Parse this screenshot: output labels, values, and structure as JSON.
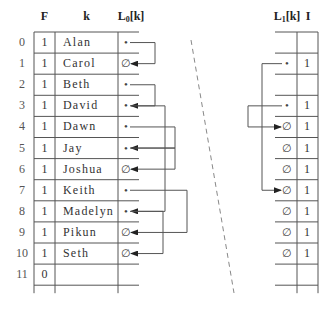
{
  "left_table": {
    "headers": {
      "F": "F",
      "k": "k",
      "L0_main": "L",
      "L0_sub": "0",
      "L0_tail": "[k]"
    },
    "rows": [
      {
        "index": "0",
        "F": "1",
        "k": "Alan",
        "L0": "•"
      },
      {
        "index": "1",
        "F": "1",
        "k": "Carol",
        "L0": "∅"
      },
      {
        "index": "2",
        "F": "1",
        "k": "Beth",
        "L0": "•"
      },
      {
        "index": "3",
        "F": "1",
        "k": "David",
        "L0": "•"
      },
      {
        "index": "4",
        "F": "1",
        "k": "Dawn",
        "L0": "•"
      },
      {
        "index": "5",
        "F": "1",
        "k": "Jay",
        "L0": "•"
      },
      {
        "index": "6",
        "F": "1",
        "k": "Joshua",
        "L0": "∅"
      },
      {
        "index": "7",
        "F": "1",
        "k": "Keith",
        "L0": "•"
      },
      {
        "index": "8",
        "F": "1",
        "k": "Madelyn",
        "L0": "•"
      },
      {
        "index": "9",
        "F": "1",
        "k": "Pikun",
        "L0": "∅"
      },
      {
        "index": "10",
        "F": "1",
        "k": "Seth",
        "L0": "∅"
      },
      {
        "index": "11",
        "F": "0",
        "k": "",
        "L0": ""
      }
    ],
    "links": [
      {
        "from": 0,
        "to": 1
      },
      {
        "from": 2,
        "to": 3
      },
      {
        "from": 3,
        "to": 8
      },
      {
        "from": 4,
        "to": 5
      },
      {
        "from": 5,
        "to": 6
      },
      {
        "from": 7,
        "to": 9
      },
      {
        "from": 8,
        "to": 10
      }
    ]
  },
  "right_table": {
    "headers": {
      "L1_main": "L",
      "L1_sub": "1",
      "L1_tail": "[k]",
      "I": "I"
    },
    "rows": [
      {
        "L1": "",
        "I": ""
      },
      {
        "L1": "•",
        "I": "1"
      },
      {
        "L1": "",
        "I": ""
      },
      {
        "L1": "•",
        "I": "1"
      },
      {
        "L1": "∅",
        "I": "1"
      },
      {
        "L1": "∅",
        "I": "1"
      },
      {
        "L1": "∅",
        "I": "1"
      },
      {
        "L1": "∅",
        "I": "1"
      },
      {
        "L1": "∅",
        "I": "1"
      },
      {
        "L1": "∅",
        "I": "1"
      },
      {
        "L1": "∅",
        "I": "1"
      },
      {
        "L1": "",
        "I": ""
      }
    ],
    "links": [
      {
        "from": 1,
        "to": 7
      },
      {
        "from": 3,
        "to": 4
      }
    ]
  },
  "colors": {
    "line": "#555555",
    "arrow": "#222222",
    "dash": "#888888"
  }
}
